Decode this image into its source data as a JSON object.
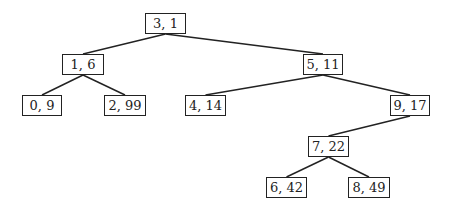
{
  "diagram": {
    "type": "binary-tree",
    "nodes": [
      {
        "id": "n31",
        "label": "3, 1",
        "x": 145,
        "y": 13,
        "w": 41
      },
      {
        "id": "n16",
        "label": "1, 6",
        "x": 62,
        "y": 54,
        "w": 42
      },
      {
        "id": "n511",
        "label": "5, 11",
        "x": 303,
        "y": 54,
        "w": 40
      },
      {
        "id": "n09",
        "label": "0, 9",
        "x": 22,
        "y": 95,
        "w": 40
      },
      {
        "id": "n299",
        "label": "2, 99",
        "x": 104,
        "y": 95,
        "w": 42
      },
      {
        "id": "n414",
        "label": "4, 14",
        "x": 185,
        "y": 95,
        "w": 41
      },
      {
        "id": "n917",
        "label": "9, 17",
        "x": 390,
        "y": 95,
        "w": 40
      },
      {
        "id": "n722",
        "label": "7, 22",
        "x": 308,
        "y": 136,
        "w": 41
      },
      {
        "id": "n642",
        "label": "6, 42",
        "x": 266,
        "y": 177,
        "w": 41
      },
      {
        "id": "n849",
        "label": "8, 49",
        "x": 348,
        "y": 177,
        "w": 42
      }
    ],
    "edges": [
      [
        "n31",
        "n16"
      ],
      [
        "n31",
        "n511"
      ],
      [
        "n16",
        "n09"
      ],
      [
        "n16",
        "n299"
      ],
      [
        "n511",
        "n414"
      ],
      [
        "n511",
        "n917"
      ],
      [
        "n917",
        "n722"
      ],
      [
        "n722",
        "n642"
      ],
      [
        "n722",
        "n849"
      ]
    ]
  }
}
